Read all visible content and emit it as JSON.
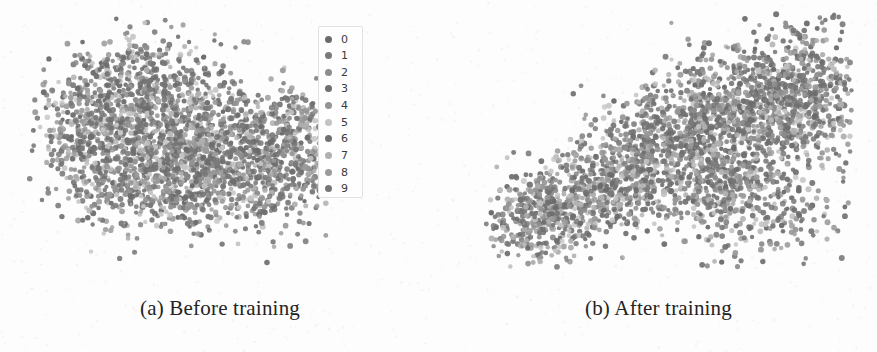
{
  "figure": {
    "background_color": "#fdfdfd",
    "style": "grayscale scanned paper figure"
  },
  "panels": [
    {
      "id": "panel-a",
      "caption": "(a) Before training",
      "has_legend": true
    },
    {
      "id": "panel-b",
      "caption": "(b) After training",
      "has_legend": false
    }
  ],
  "legend": {
    "title": "",
    "position": "upper right of panel (a)",
    "entries": [
      {
        "label": "0",
        "color": "#6b6b6b"
      },
      {
        "label": "1",
        "color": "#7a7a7a"
      },
      {
        "label": "2",
        "color": "#8d8d8d"
      },
      {
        "label": "3",
        "color": "#6f6f6f"
      },
      {
        "label": "4",
        "color": "#949494"
      },
      {
        "label": "5",
        "color": "#c3c3c3"
      },
      {
        "label": "6",
        "color": "#707070"
      },
      {
        "label": "7",
        "color": "#b0b0b0"
      },
      {
        "label": "8",
        "color": "#9b9b9b"
      },
      {
        "label": "9",
        "color": "#767676"
      }
    ]
  },
  "chart_data": {
    "type": "scatter",
    "title": "",
    "subtitle": "",
    "xlabel": "",
    "ylabel": "",
    "grid": false,
    "axes_visible": false,
    "tick_labels": [],
    "legend_position": "upper-right",
    "legend_entries": [
      "0",
      "1",
      "2",
      "3",
      "4",
      "5",
      "6",
      "7",
      "8",
      "9"
    ],
    "series_colors": [
      "#6b6b6b",
      "#7a7a7a",
      "#8d8d8d",
      "#6f6f6f",
      "#949494",
      "#c3c3c3",
      "#707070",
      "#b0b0b0",
      "#9b9b9b",
      "#767676"
    ],
    "marker_size_px": 5,
    "marker_opacity": 0.85,
    "panels": [
      {
        "name": "Before training",
        "n_points": 2600,
        "shape": "crescent / boomerang-shaped single blob, classes fully overlapping (unseparated)",
        "xlim": [
          0,
          440
        ],
        "ylim": [
          0,
          290
        ],
        "bounds_px": {
          "x0": 35,
          "x1": 322,
          "y0": 24,
          "y1": 258
        },
        "clusters": [
          {
            "cx": 120,
            "cy": 95,
            "rx": 72,
            "ry": 52,
            "weight": 0.22,
            "rot": -22
          },
          {
            "cx": 175,
            "cy": 135,
            "rx": 88,
            "ry": 58,
            "weight": 0.26,
            "rot": -12
          },
          {
            "cx": 235,
            "cy": 170,
            "rx": 80,
            "ry": 52,
            "weight": 0.22,
            "rot": 8
          },
          {
            "cx": 290,
            "cy": 140,
            "rx": 48,
            "ry": 48,
            "weight": 0.12,
            "rot": 20
          },
          {
            "cx": 150,
            "cy": 185,
            "rx": 70,
            "ry": 46,
            "weight": 0.13,
            "rot": 0
          },
          {
            "cx": 85,
            "cy": 150,
            "rx": 42,
            "ry": 42,
            "weight": 0.05,
            "rot": 0
          }
        ],
        "outlier_fraction": 0.05
      },
      {
        "name": "After training",
        "n_points": 3000,
        "shape": "diagonal elongated blob rising from lower-left to upper-right, denser and more uniform",
        "xlim": [
          0,
          437
        ],
        "ylim": [
          0,
          290
        ],
        "bounds_px": {
          "x0": 485,
          "x1": 846,
          "y0": 20,
          "y1": 262
        },
        "clusters": [
          {
            "cx": 545,
            "cy": 215,
            "rx": 52,
            "ry": 40,
            "weight": 0.13,
            "rot": -35
          },
          {
            "cx": 610,
            "cy": 180,
            "rx": 70,
            "ry": 46,
            "weight": 0.17,
            "rot": -32
          },
          {
            "cx": 680,
            "cy": 140,
            "rx": 82,
            "ry": 56,
            "weight": 0.2,
            "rot": -28
          },
          {
            "cx": 752,
            "cy": 110,
            "rx": 78,
            "ry": 62,
            "weight": 0.2,
            "rot": -18
          },
          {
            "cx": 800,
            "cy": 90,
            "rx": 58,
            "ry": 60,
            "weight": 0.15,
            "rot": 0
          },
          {
            "cx": 740,
            "cy": 200,
            "rx": 78,
            "ry": 52,
            "weight": 0.15,
            "rot": 5
          }
        ],
        "outlier_fraction": 0.03
      }
    ]
  }
}
